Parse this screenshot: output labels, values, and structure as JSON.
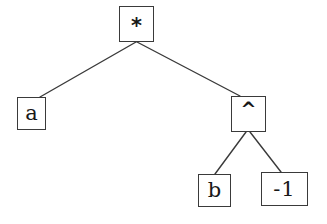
{
  "diagram": {
    "background_color": "#ffffff",
    "stroke_color": "#3a3a3a",
    "text_color": "#181818",
    "width": 327,
    "height": 224
  },
  "nodes": [
    {
      "id": "root",
      "label": "*",
      "role": "operator-multiply",
      "x": 119,
      "y": 6,
      "w": 35,
      "h": 36,
      "cx": 136.5,
      "cy": 24
    },
    {
      "id": "a",
      "label": "a",
      "role": "variable",
      "x": 17,
      "y": 97,
      "w": 29,
      "h": 33,
      "cx": 31.5,
      "cy": 113.5
    },
    {
      "id": "pow",
      "label": "^",
      "role": "operator-power",
      "x": 231,
      "y": 96,
      "w": 35,
      "h": 36,
      "cx": 248.5,
      "cy": 114
    },
    {
      "id": "b",
      "label": "b",
      "role": "variable",
      "x": 198,
      "y": 174,
      "w": 33,
      "h": 33,
      "cx": 214.5,
      "cy": 190.5
    },
    {
      "id": "neg1",
      "label": "-1",
      "role": "number",
      "x": 261,
      "y": 172,
      "w": 47,
      "h": 34,
      "cx": 284.5,
      "cy": 189
    }
  ],
  "edges": [
    {
      "id": "root-a",
      "from": "root",
      "to": "a",
      "x1": 136,
      "y1": 42,
      "x2": 40,
      "y2": 97
    },
    {
      "id": "root-pow",
      "from": "root",
      "to": "pow",
      "x1": 137,
      "y1": 42,
      "x2": 240,
      "y2": 96
    },
    {
      "id": "pow-b",
      "from": "pow",
      "to": "b",
      "x1": 246,
      "y1": 132,
      "x2": 215,
      "y2": 174
    },
    {
      "id": "pow-neg1",
      "from": "pow",
      "to": "neg1",
      "x1": 250,
      "y1": 132,
      "x2": 281,
      "y2": 172
    }
  ]
}
